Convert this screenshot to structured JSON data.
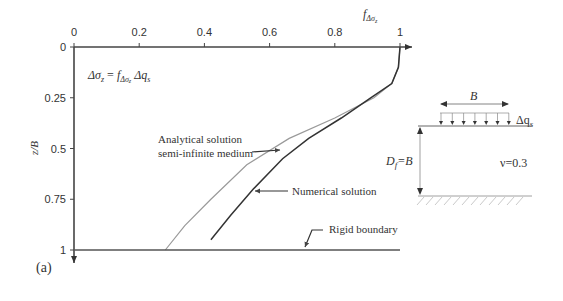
{
  "figure": {
    "panel_label": "(a)",
    "equation": {
      "lhs": "Δσ",
      "lhs_sub": "z",
      "eq": " = ",
      "f": "f",
      "f_sub": "Δσ",
      "f_sub_sub": "z",
      "rhs": " Δq",
      "rhs_sub": "s"
    },
    "x_axis_title": "f",
    "x_axis_title_sub": "Δσ",
    "x_axis_title_subsub": "z",
    "y_axis_title": "z/B",
    "annotations": {
      "analytical_line1": "Analytical solution",
      "analytical_line2": "semi-infinite medium",
      "numerical": "Numerical solution",
      "rigid": "Rigid boundary"
    },
    "diagram": {
      "width_label": "B",
      "load_label": "Δq",
      "load_label_sub": "s",
      "depth_label_D": "D",
      "depth_label_sub": "f",
      "depth_label_eq": "=B",
      "poisson_label": "ν=0.3"
    }
  },
  "chart_data": {
    "type": "line",
    "title": "",
    "xlabel": "f_Δσz",
    "ylabel": "z/B",
    "xlim": [
      0,
      1
    ],
    "ylim": [
      1,
      0
    ],
    "y_inverted": true,
    "x_ticks": [
      "0",
      "0.2",
      "0.4",
      "0.6",
      "0.8",
      "1"
    ],
    "y_ticks": [
      "0",
      "0.25",
      "0.5",
      "0.75",
      "1"
    ],
    "grid": false,
    "legend": "inline annotations with arrows",
    "series": [
      {
        "name": "Analytical solution semi-infinite medium",
        "color": "#9a9a9a",
        "x": [
          1.0,
          0.995,
          0.975,
          0.92,
          0.8,
          0.66,
          0.53,
          0.42,
          0.34,
          0.28
        ],
        "y": [
          0.0,
          0.1,
          0.18,
          0.25,
          0.35,
          0.45,
          0.58,
          0.75,
          0.88,
          1.0
        ]
      },
      {
        "name": "Numerical solution",
        "color": "#333333",
        "x": [
          1.0,
          0.995,
          0.975,
          0.91,
          0.82,
          0.72,
          0.64,
          0.55,
          0.48,
          0.42
        ],
        "y": [
          0.0,
          0.1,
          0.18,
          0.25,
          0.35,
          0.45,
          0.55,
          0.7,
          0.83,
          0.95
        ]
      },
      {
        "name": "Rigid boundary",
        "color": "#555555",
        "x": [
          0,
          1.0
        ],
        "y": [
          1.0,
          1.0
        ]
      }
    ],
    "annotations": [
      "Δσz = fΔσz Δqs",
      "Analytical solution semi-infinite medium",
      "Numerical solution",
      "Rigid boundary",
      "B",
      "Δqs",
      "Df = B",
      "ν = 0.3",
      "(a)"
    ],
    "axis_pixels": {
      "x0": 74,
      "x1": 400,
      "y0": 47,
      "y1": 250
    }
  }
}
